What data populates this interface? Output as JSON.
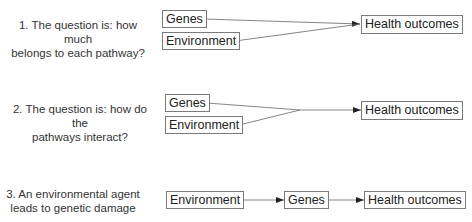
{
  "rows": [
    {
      "question": "1. The question is: how much\nbelongs to each pathway?",
      "nodes": {
        "genes": "Genes",
        "environment": "Environment",
        "outcome": "Health outcomes"
      }
    },
    {
      "question": "2. The question is: how do the\npathways interact?",
      "nodes": {
        "genes": "Genes",
        "environment": "Environment",
        "outcome": "Health outcomes"
      }
    },
    {
      "question": "3. An environmental agent\nleads to genetic damage",
      "nodes": {
        "environment": "Environment",
        "genes": "Genes",
        "outcome": "Health outcomes"
      }
    }
  ]
}
